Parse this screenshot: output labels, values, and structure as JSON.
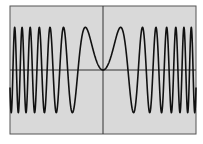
{
  "chart_data": {
    "type": "line",
    "title": "",
    "function": "y = sin(x^2)",
    "xlabel": "",
    "ylabel": "",
    "xlim": [
      -6.6,
      6.6
    ],
    "ylim": [
      -1.5,
      1.5
    ],
    "grid": false,
    "axes_visible": true,
    "series": [
      {
        "name": "sin(x^2)",
        "x_range": [
          -6.6,
          6.6
        ],
        "samples": 1200
      }
    ],
    "colors": {
      "background": "#d9d9d9",
      "frame": "#555555",
      "axes": "#333333",
      "curve": "#111111"
    },
    "frame": {
      "left": 10,
      "top": 6,
      "right": 196,
      "bottom": 134
    }
  }
}
